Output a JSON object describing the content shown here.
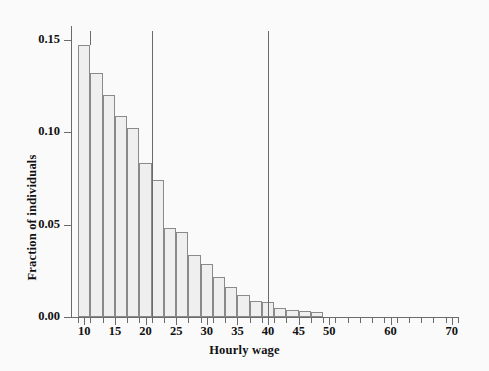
{
  "chart_data": {
    "type": "bar",
    "title": "",
    "subtitle": "",
    "xlabel": "Hourly wage",
    "ylabel": "Fraction of individuals",
    "xlim": [
      8,
      71
    ],
    "ylim": [
      0.0,
      0.155
    ],
    "grid": false,
    "legend": null,
    "bin_width": 2,
    "x_tick_labels": [
      "10",
      "15",
      "20",
      "25",
      "30",
      "35",
      "40",
      "45",
      "50",
      "60",
      "70"
    ],
    "x_tick_values": [
      10,
      15,
      20,
      25,
      30,
      35,
      40,
      45,
      50,
      60,
      70
    ],
    "y_tick_labels": [
      "0.00",
      "0.05",
      "0.10",
      "0.15"
    ],
    "y_tick_values": [
      0.0,
      0.05,
      0.1,
      0.15
    ],
    "bins": [
      {
        "x0": 9,
        "x1": 11,
        "value": 0.1475
      },
      {
        "x0": 11,
        "x1": 13,
        "value": 0.132
      },
      {
        "x0": 13,
        "x1": 15,
        "value": 0.1205
      },
      {
        "x0": 15,
        "x1": 17,
        "value": 0.109
      },
      {
        "x0": 17,
        "x1": 19,
        "value": 0.1025
      },
      {
        "x0": 19,
        "x1": 21,
        "value": 0.0835
      },
      {
        "x0": 21,
        "x1": 23,
        "value": 0.0745
      },
      {
        "x0": 23,
        "x1": 25,
        "value": 0.048
      },
      {
        "x0": 25,
        "x1": 27,
        "value": 0.046
      },
      {
        "x0": 27,
        "x1": 29,
        "value": 0.0335
      },
      {
        "x0": 29,
        "x1": 31,
        "value": 0.029
      },
      {
        "x0": 31,
        "x1": 33,
        "value": 0.0215
      },
      {
        "x0": 33,
        "x1": 35,
        "value": 0.016
      },
      {
        "x0": 35,
        "x1": 37,
        "value": 0.012
      },
      {
        "x0": 37,
        "x1": 39,
        "value": 0.0085
      },
      {
        "x0": 39,
        "x1": 41,
        "value": 0.008
      },
      {
        "x0": 41,
        "x1": 43,
        "value": 0.005
      },
      {
        "x0": 43,
        "x1": 45,
        "value": 0.004
      },
      {
        "x0": 45,
        "x1": 47,
        "value": 0.0035
      },
      {
        "x0": 47,
        "x1": 49,
        "value": 0.0028
      }
    ],
    "categories": [
      "9-11",
      "11-13",
      "13-15",
      "15-17",
      "17-19",
      "19-21",
      "21-23",
      "23-25",
      "25-27",
      "27-29",
      "29-31",
      "31-33",
      "33-35",
      "35-37",
      "37-39",
      "39-41",
      "41-43",
      "43-45",
      "45-47",
      "47-49"
    ],
    "values": [
      0.1475,
      0.132,
      0.1205,
      0.109,
      0.1025,
      0.0835,
      0.0745,
      0.048,
      0.046,
      0.0335,
      0.029,
      0.0215,
      0.016,
      0.012,
      0.0085,
      0.008,
      0.005,
      0.004,
      0.0035,
      0.0028
    ],
    "annotations": [
      {
        "name": "reference-line-left",
        "type": "vline",
        "x": 21.0,
        "y_top": 0.155,
        "y_bottom": 0.0
      },
      {
        "name": "reference-line-right",
        "type": "vline",
        "x": 40.0,
        "y_top": 0.155,
        "y_bottom": 0.0
      },
      {
        "name": "peak-marker",
        "type": "vtick",
        "x": 11.0,
        "y_top": 0.158,
        "y_bottom": 0.1475
      }
    ],
    "colors": {
      "bar_fill": "#efefef",
      "bar_edge": "#8a8a8a",
      "axis": "#6b6b6b",
      "text": "#111111",
      "background": "#fafafa"
    }
  }
}
